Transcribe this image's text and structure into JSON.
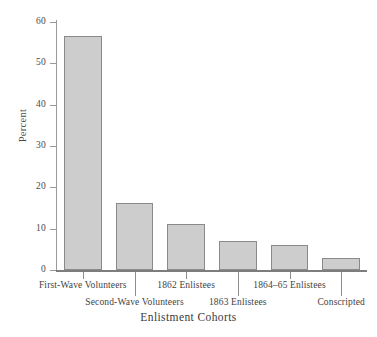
{
  "chart_data": {
    "type": "bar",
    "title": "",
    "subtitle": "",
    "xlabel": "Enlistment Cohorts",
    "ylabel": "Percent",
    "categories": [
      "First-Wave Volunteers",
      "Second-Wave Volunteers",
      "1862 Enlistees",
      "1863 Enlistees",
      "1864–65 Enlistees",
      "Conscripted"
    ],
    "values": [
      56.5,
      16.2,
      11.1,
      7.0,
      6.0,
      3.0
    ],
    "ylim": [
      0,
      60
    ],
    "yticks": [
      0,
      10,
      20,
      30,
      40,
      50,
      60
    ],
    "ytick_labels": [
      "0",
      "10",
      "20",
      "30",
      "40",
      "50",
      "60"
    ],
    "grid": false,
    "legend": "none",
    "bar_fill_color": "#cdcdcd",
    "bar_border_color": "#8a8a8a",
    "axis_color": "#8d8d8d",
    "background_color": "#ffffff",
    "label_rows": [
      0,
      1,
      0,
      1,
      0,
      1
    ]
  }
}
